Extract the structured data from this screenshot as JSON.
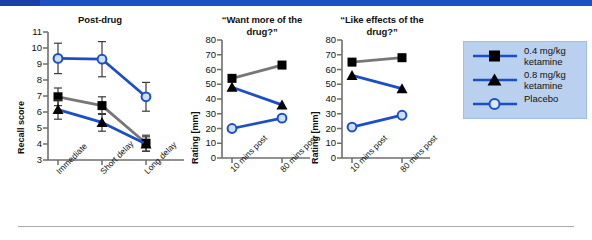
{
  "figure": {
    "top_banner_color": "#1f4fc4",
    "series_colors": {
      "dose_low_line": "#777777",
      "dose_high_line": "#1b4fc8",
      "placebo_line": "#1b4fc8",
      "marker_fill_dark": "#000000",
      "placebo_marker_fill": "#c8dcf5"
    }
  },
  "legend": {
    "position": "right",
    "entries": [
      {
        "label_line1": "0.4 mg/kg",
        "label_line2": "ketamine",
        "marker": "square",
        "line_color": "#1b4fc8"
      },
      {
        "label_line1": "0.8 mg/kg",
        "label_line2": "ketamine",
        "marker": "triangle",
        "line_color": "#1b4fc8"
      },
      {
        "label_line1": "Placebo",
        "label_line2": "",
        "marker": "open-circle",
        "line_color": "#1b4fc8"
      }
    ]
  },
  "chart_data": [
    {
      "type": "line",
      "title": "Post-drug",
      "xlabel": "",
      "ylabel": "Recall score",
      "categories": [
        "Immediate",
        "Short delay",
        "Long delay"
      ],
      "yticks": [
        3,
        4,
        5,
        6,
        7,
        8,
        9,
        10,
        11
      ],
      "ylim": [
        3,
        11
      ],
      "grid": false,
      "error_bars": true,
      "series": [
        {
          "name": "0.4 mg/kg ketamine",
          "marker": "square",
          "color": "#777777",
          "values": [
            6.95,
            6.4,
            4.05
          ],
          "errors": [
            0.55,
            0.55,
            0.5
          ]
        },
        {
          "name": "0.8 mg/kg ketamine",
          "marker": "triangle",
          "color": "#1b4fc8",
          "values": [
            6.15,
            5.35,
            4.0
          ],
          "errors": [
            0.6,
            0.55,
            0.45
          ]
        },
        {
          "name": "Placebo",
          "marker": "open-circle",
          "color": "#1b4fc8",
          "values": [
            9.35,
            9.3,
            6.95
          ],
          "errors": [
            0.95,
            1.1,
            0.9
          ]
        }
      ]
    },
    {
      "type": "line",
      "title": "“Want more of the drug?”",
      "title_line1": "“Want more of the",
      "title_line2": "drug?”",
      "xlabel": "",
      "ylabel": "Rating [mm]",
      "categories": [
        "10 mins post",
        "80 mins post"
      ],
      "yticks": [
        0,
        10,
        20,
        30,
        40,
        50,
        60,
        70,
        80
      ],
      "ylim": [
        0,
        80
      ],
      "grid": false,
      "error_bars": false,
      "series": [
        {
          "name": "0.4 mg/kg ketamine",
          "marker": "square",
          "color": "#777777",
          "values": [
            54,
            63
          ]
        },
        {
          "name": "0.8 mg/kg ketamine",
          "marker": "triangle",
          "color": "#1b4fc8",
          "values": [
            48,
            36
          ]
        },
        {
          "name": "Placebo",
          "marker": "open-circle",
          "color": "#1b4fc8",
          "values": [
            20,
            27
          ]
        }
      ]
    },
    {
      "type": "line",
      "title": "“Like effects of the drug?”",
      "title_line1": "“Like effects of the",
      "title_line2": "drug?”",
      "xlabel": "",
      "ylabel": "Rating [mm]",
      "categories": [
        "10 mins post",
        "80 mins post"
      ],
      "yticks": [
        0,
        10,
        20,
        30,
        40,
        50,
        60,
        70,
        80
      ],
      "ylim": [
        0,
        80
      ],
      "grid": false,
      "error_bars": false,
      "series": [
        {
          "name": "0.4 mg/kg ketamine",
          "marker": "square",
          "color": "#777777",
          "values": [
            65,
            68
          ]
        },
        {
          "name": "0.8 mg/kg ketamine",
          "marker": "triangle",
          "color": "#1b4fc8",
          "values": [
            56,
            47
          ]
        },
        {
          "name": "Placebo",
          "marker": "open-circle",
          "color": "#1b4fc8",
          "values": [
            21,
            29
          ]
        }
      ]
    }
  ]
}
